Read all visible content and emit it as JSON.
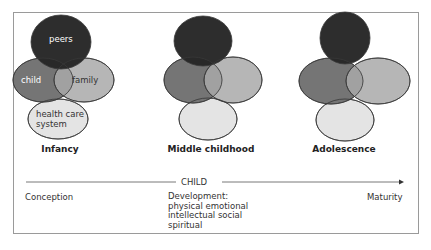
{
  "stages": [
    {
      "label": "Infancy",
      "circles": {
        "peers": "peers",
        "child": "child",
        "family": "family",
        "health": "health care system"
      }
    },
    {
      "label": "Middle childhood"
    },
    {
      "label": "Adolescence"
    }
  ],
  "circle_labels": {
    "peers": "peers",
    "child": "child",
    "family": "family",
    "health_line1": "health care",
    "health_line2": "system"
  },
  "timeline": {
    "title": "CHILD",
    "start": "Conception",
    "end": "Maturity",
    "development": [
      "Development:",
      "physical emotional",
      "intellectual social",
      "spiritual"
    ]
  },
  "colors": {
    "peers": "#262626",
    "child": "#6e6e6e",
    "family": "#a9a9a9",
    "health": "#e3e3e3",
    "outline": "#3a3a3a",
    "frame": "#9a9a9a"
  }
}
